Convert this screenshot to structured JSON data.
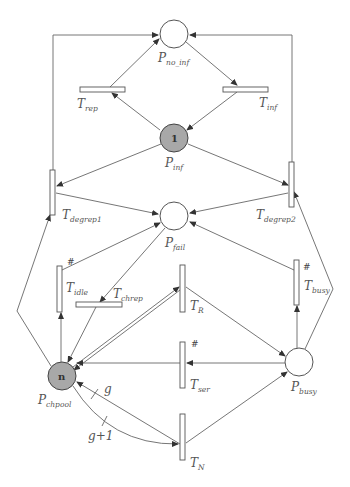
{
  "diagram": {
    "type": "petri-net",
    "colors": {
      "stroke": "#555555",
      "marked_place_fill": "#a8a8a8",
      "place_fill": "#ffffff",
      "background": "#ffffff"
    },
    "places": [
      {
        "id": "P_no_inf",
        "base": "P",
        "sub": "no_inf",
        "tokens": ""
      },
      {
        "id": "P_inf",
        "base": "P",
        "sub": "inf",
        "tokens": "1"
      },
      {
        "id": "P_fail",
        "base": "P",
        "sub": "fail",
        "tokens": ""
      },
      {
        "id": "P_chpool",
        "base": "P",
        "sub": "chpool",
        "tokens": "n"
      },
      {
        "id": "P_busy",
        "base": "P",
        "sub": "busy",
        "tokens": ""
      }
    ],
    "transitions": [
      {
        "id": "T_rep",
        "base": "T",
        "sub": "rep",
        "orientation": "horizontal",
        "mark": ""
      },
      {
        "id": "T_inf",
        "base": "T",
        "sub": "inf",
        "orientation": "horizontal",
        "mark": ""
      },
      {
        "id": "T_degrep1",
        "base": "T",
        "sub": "degrep1",
        "orientation": "vertical",
        "mark": ""
      },
      {
        "id": "T_degrep2",
        "base": "T",
        "sub": "degrep2",
        "orientation": "vertical",
        "mark": ""
      },
      {
        "id": "T_idle",
        "base": "T",
        "sub": "idle",
        "orientation": "vertical",
        "mark": "#"
      },
      {
        "id": "T_chrep",
        "base": "T",
        "sub": "chrep",
        "orientation": "horizontal",
        "mark": ""
      },
      {
        "id": "T_R",
        "base": "T",
        "sub": "R",
        "orientation": "vertical",
        "mark": ""
      },
      {
        "id": "T_busy",
        "base": "T",
        "sub": "busy",
        "orientation": "vertical",
        "mark": "#"
      },
      {
        "id": "T_ser",
        "base": "T",
        "sub": "ser",
        "orientation": "vertical",
        "mark": "#"
      },
      {
        "id": "T_N",
        "base": "T",
        "sub": "N",
        "orientation": "vertical",
        "mark": ""
      }
    ],
    "arcs": [
      {
        "from": "P_no_inf",
        "to": "T_inf",
        "weight": ""
      },
      {
        "from": "T_inf",
        "to": "P_inf",
        "weight": ""
      },
      {
        "from": "P_inf",
        "to": "T_rep",
        "weight": ""
      },
      {
        "from": "T_rep",
        "to": "P_no_inf",
        "weight": ""
      },
      {
        "from": "P_inf",
        "to": "T_degrep1",
        "weight": ""
      },
      {
        "from": "P_inf",
        "to": "T_degrep2",
        "weight": ""
      },
      {
        "from": "T_degrep1",
        "to": "P_no_inf",
        "weight": ""
      },
      {
        "from": "T_degrep2",
        "to": "P_no_inf",
        "weight": ""
      },
      {
        "from": "T_degrep1",
        "to": "P_fail",
        "weight": ""
      },
      {
        "from": "T_degrep2",
        "to": "P_fail",
        "weight": ""
      },
      {
        "from": "T_idle",
        "to": "P_fail",
        "weight": ""
      },
      {
        "from": "T_busy",
        "to": "P_fail",
        "weight": ""
      },
      {
        "from": "P_fail",
        "to": "T_chrep",
        "weight": ""
      },
      {
        "from": "T_chrep",
        "to": "P_chpool",
        "weight": ""
      },
      {
        "from": "P_chpool",
        "to": "T_idle",
        "weight": ""
      },
      {
        "from": "P_chpool",
        "to": "T_degrep1",
        "weight": ""
      },
      {
        "from": "P_chpool",
        "to": "T_R",
        "weight": ""
      },
      {
        "from": "T_R",
        "to": "P_chpool",
        "weight": ""
      },
      {
        "from": "T_R",
        "to": "P_busy",
        "weight": ""
      },
      {
        "from": "P_busy",
        "to": "T_ser",
        "weight": ""
      },
      {
        "from": "T_ser",
        "to": "P_chpool",
        "weight": ""
      },
      {
        "from": "P_busy",
        "to": "T_busy",
        "weight": ""
      },
      {
        "from": "P_busy",
        "to": "T_degrep2",
        "weight": ""
      },
      {
        "from": "P_chpool",
        "to": "T_N",
        "weight": "g+1"
      },
      {
        "from": "T_N",
        "to": "P_chpool",
        "weight": "g"
      },
      {
        "from": "T_N",
        "to": "P_busy",
        "weight": ""
      }
    ]
  }
}
